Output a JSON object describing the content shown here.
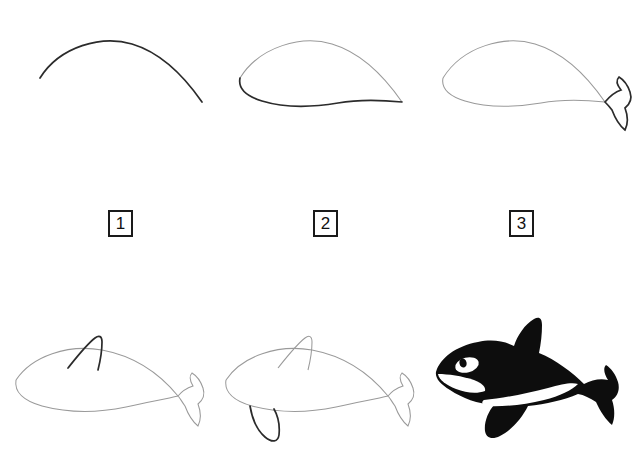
{
  "sheet": {
    "title": "Orca / killer whale step-by-step drawing tutorial",
    "background_color": "#ffffff",
    "line_color_previous": "#9a9a9a",
    "line_color_new": "#2b2b2b",
    "fill_color_final": "#0d0d0d",
    "highlight_color_final": "#ffffff",
    "columns": 3,
    "rows": 2
  },
  "labels": [
    {
      "text": "1",
      "name": "step-number-1"
    },
    {
      "text": "2",
      "name": "step-number-2"
    },
    {
      "text": "3",
      "name": "step-number-3"
    }
  ],
  "steps": [
    {
      "index": 1,
      "name": "step-back-arc",
      "description": "A single long arc forming the whale's back",
      "new_strokes": 1
    },
    {
      "index": 2,
      "name": "step-belly-curve",
      "description": "Lower belly curve added, closing the body outline",
      "new_strokes": 1
    },
    {
      "index": 3,
      "name": "step-tail-fluke",
      "description": "Forked tail fluke added at the right end of the body",
      "new_strokes": 1
    },
    {
      "index": 4,
      "name": "step-dorsal-fin",
      "description": "Tall curved dorsal fin added on the back",
      "new_strokes": 1
    },
    {
      "index": 5,
      "name": "step-pectoral-flipper",
      "description": "Pectoral flipper added hanging below the body",
      "new_strokes": 1
    },
    {
      "index": 6,
      "name": "step-final-filled-orca",
      "description": "Finished orca filled black with white eye patch, white chin and white flank patch",
      "new_strokes": 0
    }
  ]
}
